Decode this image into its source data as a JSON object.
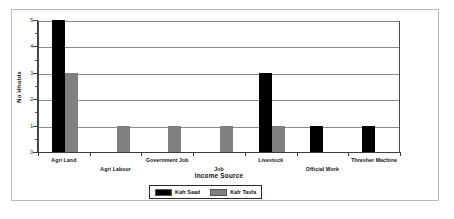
{
  "chart_data": {
    "type": "bar",
    "title": "",
    "xlabel": "Income Source",
    "ylabel": "No Hholds",
    "ylim": [
      0,
      5
    ],
    "yticks": [
      0,
      1,
      2,
      3,
      4,
      5
    ],
    "ytick_labels": [
      "0",
      "1",
      "2",
      "3",
      "4",
      "5"
    ],
    "minor_yticks": [
      0.5,
      1.5,
      2.5,
      3.5,
      4.5
    ],
    "grid": true,
    "grid_axis": "y",
    "legend_position": "bottom-center",
    "categories": [
      "Agri Land",
      "Agri Labour",
      "Government Job",
      "Job",
      "Livestock",
      "Official Work",
      "Thresher Machine"
    ],
    "series": [
      {
        "name": "Kafr Saad",
        "color": "#000000",
        "values": [
          5,
          0,
          0,
          0,
          3,
          1,
          1
        ]
      },
      {
        "name": "Kafr Tasfa",
        "color": "#808080",
        "values": [
          3,
          1,
          1,
          1,
          1,
          0,
          0
        ]
      }
    ]
  },
  "legend": {
    "entries": [
      {
        "label": "Kafr Saad"
      },
      {
        "label": "Kafr Tasfa"
      }
    ]
  }
}
